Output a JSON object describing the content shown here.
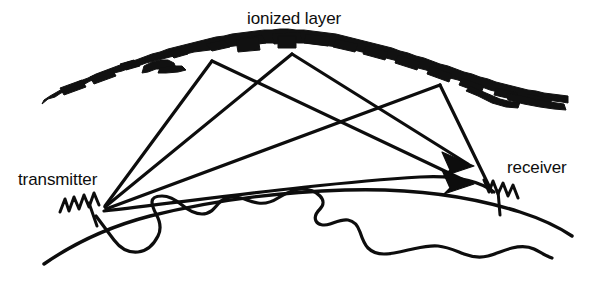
{
  "figure": {
    "title_alt": "Ionospheric skywave propagation diagram",
    "background_color": "#ffffff",
    "ink_color": "#0d0d0d",
    "labels": {
      "ionized_layer": "ionized layer",
      "transmitter": "transmitter",
      "receiver": "receiver"
    },
    "elements": {
      "ionized_layer_name": "ionized-layer-band",
      "earth_surface_name": "earth-surface-arc",
      "coastline_name": "coastline-outline",
      "transmitter_antenna_name": "transmitter-antenna",
      "receiver_antenna_name": "receiver-antenna"
    },
    "geometry": {
      "transmitter_point": [
        104,
        206
      ],
      "receiver_point": [
        492,
        190
      ],
      "reflection_points": [
        [
          212,
          62
        ],
        [
          292,
          55
        ],
        [
          440,
          86
        ]
      ],
      "arrowhead_points": [
        [
          470,
          163
        ],
        [
          470,
          181
        ]
      ],
      "ionized_layer_span": [
        42,
        568
      ],
      "ionized_layer_apex_y": 44
    },
    "ray_count": 3,
    "arrow_count": 2
  }
}
